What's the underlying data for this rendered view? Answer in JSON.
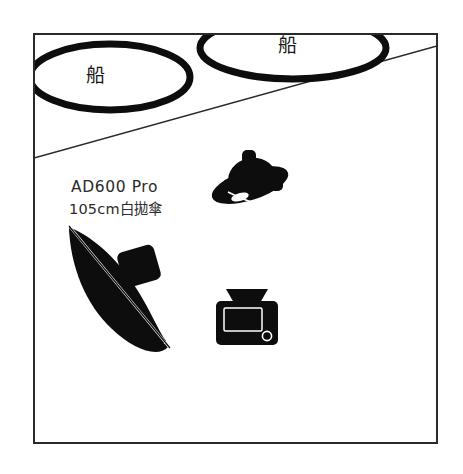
{
  "diagram": {
    "background_color": "#ffffff",
    "frame": {
      "name": "room-frame",
      "stroke_color": "#2a2a2a",
      "x": 34,
      "y": 34,
      "width": 403,
      "height": 409
    },
    "divider_line": {
      "name": "floor-divider-line",
      "description": "thin diagonal line crossing the room from left edge to right edge",
      "stroke_color": "#2a2a2a",
      "x1": 34,
      "y1": 158,
      "x2": 437,
      "y2": 46
    },
    "boats": [
      {
        "id": "boat-left",
        "label": "船",
        "cx": 110,
        "cy": 77,
        "rx": 80,
        "ry": 33,
        "stroke_color": "#0d0d0d",
        "stroke_width": 7
      },
      {
        "id": "boat-right",
        "label": "船",
        "cx": 293,
        "cy": 48,
        "rx": 93,
        "ry": 31,
        "stroke_color": "#0d0d0d",
        "stroke_width": 7
      }
    ],
    "light": {
      "name_label": "AD600 Pro",
      "spec_label": "105cm白拋傘",
      "fill_color": "#0d0d0d"
    },
    "strobe": {
      "name": "bare-strobe-reflector",
      "fill_color": "#0d0d0d",
      "cx": 250,
      "cy": 182
    },
    "camera": {
      "name": "camera-top-view",
      "fill_color": "#0d0d0d",
      "cx": 247,
      "cy": 317
    }
  }
}
